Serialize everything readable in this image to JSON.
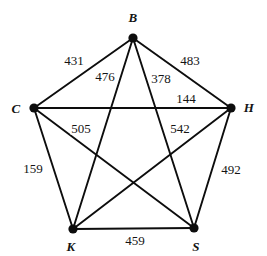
{
  "figure": {
    "kind": "weighted-complete-graph",
    "name": "K5 weighted graph",
    "background_color": "#ffffff",
    "ink_color": "#0d0d0d",
    "width": 267,
    "height": 256
  },
  "chart_data": {
    "type": "diagram",
    "graph_type": "complete-graph",
    "title": "",
    "vertex_count": 5,
    "edge_count": 10,
    "vertices": [
      {
        "id": "B",
        "label": "B",
        "x": 133,
        "y": 38,
        "label_x": 133,
        "label_y": 17
      },
      {
        "id": "C",
        "label": "C",
        "x": 34,
        "y": 108,
        "label_x": 16,
        "label_y": 108
      },
      {
        "id": "H",
        "label": "H",
        "x": 231,
        "y": 108,
        "label_x": 249,
        "label_y": 107
      },
      {
        "id": "K",
        "label": "K",
        "x": 73,
        "y": 229,
        "label_x": 71,
        "label_y": 246
      },
      {
        "id": "S",
        "label": "S",
        "x": 194,
        "y": 228,
        "label_x": 196,
        "label_y": 246
      }
    ],
    "edges": [
      {
        "from": "B",
        "to": "C",
        "weight": 431,
        "label": "431",
        "label_x": 74,
        "label_y": 60
      },
      {
        "from": "B",
        "to": "H",
        "weight": 483,
        "label": "483",
        "label_x": 190,
        "label_y": 60
      },
      {
        "from": "B",
        "to": "K",
        "weight": 476,
        "label": "476",
        "label_x": 105,
        "label_y": 76
      },
      {
        "from": "B",
        "to": "S",
        "weight": 378,
        "label": "378",
        "label_x": 161,
        "label_y": 78
      },
      {
        "from": "C",
        "to": "H",
        "weight": 144,
        "label": "144",
        "label_x": 186,
        "label_y": 98
      },
      {
        "from": "C",
        "to": "S",
        "weight": 505,
        "label": "505",
        "label_x": 81,
        "label_y": 128
      },
      {
        "from": "H",
        "to": "K",
        "weight": 542,
        "label": "542",
        "label_x": 180,
        "label_y": 128
      },
      {
        "from": "C",
        "to": "K",
        "weight": 159,
        "label": "159",
        "label_x": 33,
        "label_y": 168
      },
      {
        "from": "H",
        "to": "S",
        "weight": 492,
        "label": "492",
        "label_x": 231,
        "label_y": 169
      },
      {
        "from": "K",
        "to": "S",
        "weight": 459,
        "label": "459",
        "label_x": 135,
        "label_y": 240
      }
    ]
  }
}
